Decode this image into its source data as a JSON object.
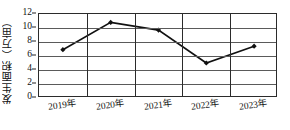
{
  "chart_data": {
    "type": "line",
    "title": "",
    "subtitle": "",
    "xlabel": "",
    "ylabel": "发生面积（万亩）",
    "categories": [
      "2019年",
      "2020年",
      "2021年",
      "2022年",
      "2023年"
    ],
    "values": [
      6.9,
      10.8,
      9.7,
      5.0,
      7.4
    ],
    "series": [
      {
        "name": "发生面积",
        "values": [
          6.9,
          10.8,
          9.7,
          5.0,
          7.4
        ]
      }
    ],
    "ylim": [
      0,
      12
    ],
    "ytick_values": [
      0,
      2,
      4,
      6,
      8,
      10,
      12
    ],
    "ytick_labels": [
      "0",
      "2",
      "4",
      "6",
      "8",
      "10",
      "12"
    ],
    "grid": true,
    "grid_axis": "both",
    "legend": false,
    "legend_position": "none",
    "marker": "diamond",
    "line_color": "#111111",
    "grid_color": "#5a5a5a",
    "axis_color": "#2b2b2b",
    "background_color": "#ffffff",
    "annotations": []
  }
}
